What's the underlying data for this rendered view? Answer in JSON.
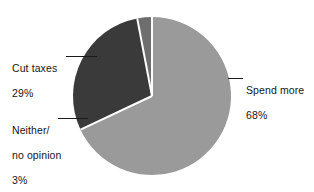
{
  "chart_data": {
    "type": "pie",
    "title": "",
    "subtitle": "",
    "xlabel": "",
    "ylabel": "",
    "legend_position": "none",
    "grid": false,
    "units": "percent",
    "start_angle_deg": 0,
    "direction": "clockwise",
    "categories": [
      "Spend more",
      "Cut taxes",
      "Neither/ no opinion"
    ],
    "values": [
      68,
      29,
      3
    ],
    "slices": [
      {
        "label": "Spend more",
        "label_lines": [
          "Spend more",
          "68%"
        ],
        "value": 68,
        "value_text": "68%",
        "color": "#9a9a9a",
        "start_deg": 0,
        "end_deg": 244.8,
        "leader_side": "right"
      },
      {
        "label": "Cut taxes",
        "label_lines": [
          "Cut taxes",
          "29%"
        ],
        "value": 29,
        "value_text": "29%",
        "color": "#3a3a3a",
        "start_deg": 244.8,
        "end_deg": 349.2,
        "leader_side": "left"
      },
      {
        "label": "Neither/ no opinion",
        "label_lines": [
          "Neither/",
          "no opinion",
          "3%"
        ],
        "value": 3,
        "value_text": "3%",
        "color": "#6e6e6e",
        "start_deg": 349.2,
        "end_deg": 360,
        "leader_side": "left"
      }
    ],
    "geometry": {
      "center_x": 152,
      "center_y": 96,
      "radius": 79,
      "separator_color": "#ffffff",
      "separator_width": 2
    },
    "background_color": "#ffffff",
    "leader_line_color": "#1a1a1a"
  },
  "labels": {
    "cut_taxes": {
      "line1": "Cut taxes",
      "line2": "29%"
    },
    "neither": {
      "line1": "Neither/",
      "line2": "no opinion",
      "line3": "3%"
    },
    "spend_more": {
      "line1": "Spend more",
      "line2": "68%"
    }
  }
}
